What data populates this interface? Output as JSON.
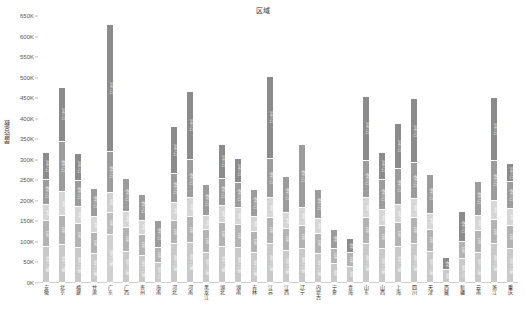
{
  "chart_data": {
    "type": "bar",
    "title": "区域",
    "xlabel": "",
    "ylabel": "居民总数",
    "ylim": [
      0,
      650000
    ],
    "yticks": [
      "0K",
      "50K",
      "100K",
      "150K",
      "200K",
      "250K",
      "300K",
      "350K",
      "400K",
      "450K",
      "500K",
      "550K",
      "600K",
      "650K"
    ],
    "ytick_values": [
      0,
      50000,
      100000,
      150000,
      200000,
      250000,
      300000,
      350000,
      400000,
      450000,
      500000,
      550000,
      600000,
      650000
    ],
    "stacked": true,
    "grid": false,
    "legend": "none",
    "series": [
      {
        "name": "年龄段一",
        "color": "#c9c9c9"
      },
      {
        "name": "年龄段二",
        "color": "#b0b0b0"
      },
      {
        "name": "年龄段三",
        "color": "#d4d4d4"
      },
      {
        "name": "年龄段四",
        "color": "#9a9a9a"
      },
      {
        "name": "年龄段五",
        "color": "#8a8a8a"
      }
    ],
    "categories": [
      "安徽",
      "北京",
      "福建",
      "甘肃",
      "广东",
      "广西",
      "贵州",
      "海南",
      "河北",
      "河南",
      "黑龙江",
      "湖北",
      "湖南",
      "吉林",
      "江苏",
      "江西",
      "辽宁",
      "内蒙古",
      "宁夏",
      "青海",
      "山东",
      "山西",
      "上海",
      "四川",
      "天津",
      "西藏",
      "新疆",
      "云南",
      "浙江",
      "重庆"
    ],
    "bars": [
      {
        "label": "安徽",
        "total": 316000,
        "segments": [
          {
            "value": 88000,
            "label": "青年人口数",
            "shade": "#c9c9c9"
          },
          {
            "value": 62000,
            "label": "壮年",
            "shade": "#b3b3b3"
          },
          {
            "value": 40000,
            "label": "中年",
            "shade": "#d6d6d6"
          },
          {
            "value": 60000,
            "label": "老年人口",
            "shade": "#9c9c9c"
          },
          {
            "value": 66000,
            "label": "少年人口",
            "shade": "#8b8b8b"
          }
        ]
      },
      {
        "label": "北京",
        "total": 476000,
        "segments": [
          {
            "value": 92000,
            "label": "青年人口数",
            "shade": "#c9c9c9"
          },
          {
            "value": 70000,
            "label": "壮年",
            "shade": "#b3b3b3"
          },
          {
            "value": 60000,
            "label": "中年",
            "shade": "#d6d6d6"
          },
          {
            "value": 122000,
            "label": "老年人口",
            "shade": "#9c9c9c"
          },
          {
            "value": 132000,
            "label": "少年人口",
            "shade": "#8b8b8b"
          }
        ]
      },
      {
        "label": "福建",
        "total": 313000,
        "segments": [
          {
            "value": 86000,
            "label": "青年人口数",
            "shade": "#c9c9c9"
          },
          {
            "value": 58000,
            "label": "壮年",
            "shade": "#b3b3b3"
          },
          {
            "value": 42000,
            "label": "中年",
            "shade": "#d6d6d6"
          },
          {
            "value": 62000,
            "label": "老年人口",
            "shade": "#9c9c9c"
          },
          {
            "value": 65000,
            "label": "少年人口",
            "shade": "#8b8b8b"
          }
        ]
      },
      {
        "label": "甘肃",
        "total": 230000,
        "segments": [
          {
            "value": 70000,
            "label": "青年人口数",
            "shade": "#c9c9c9"
          },
          {
            "value": 52000,
            "label": "壮年",
            "shade": "#b3b3b3"
          },
          {
            "value": 38000,
            "label": "中年",
            "shade": "#d6d6d6"
          },
          {
            "value": 70000,
            "label": "老年人口",
            "shade": "#9c9c9c"
          }
        ]
      },
      {
        "label": "广东",
        "total": 628000,
        "segments": [
          {
            "value": 118000,
            "label": "青年人口数",
            "shade": "#d0d0d0"
          },
          {
            "value": 52000,
            "label": "壮年",
            "shade": "#bdbdbd"
          },
          {
            "value": 50000,
            "label": "中年",
            "shade": "#cfcfcf"
          },
          {
            "value": 100000,
            "label": "老年人口",
            "shade": "#9c9c9c"
          },
          {
            "value": 308000,
            "label": "少年人口",
            "shade": "#8b8b8b"
          }
        ]
      },
      {
        "label": "广西",
        "total": 253000,
        "segments": [
          {
            "value": 76000,
            "label": "青年人口数",
            "shade": "#c9c9c9"
          },
          {
            "value": 58000,
            "label": "壮年",
            "shade": "#b3b3b3"
          },
          {
            "value": 40000,
            "label": "中年",
            "shade": "#d6d6d6"
          },
          {
            "value": 79000,
            "label": "老年人口",
            "shade": "#9c9c9c"
          }
        ]
      },
      {
        "label": "贵州",
        "total": 214000,
        "segments": [
          {
            "value": 66000,
            "label": "青年人口数",
            "shade": "#c9c9c9"
          },
          {
            "value": 52000,
            "label": "壮年",
            "shade": "#b3b3b3"
          },
          {
            "value": 34000,
            "label": "中年",
            "shade": "#d6d6d6"
          },
          {
            "value": 62000,
            "label": "老年人口",
            "shade": "#9c9c9c"
          }
        ]
      },
      {
        "label": "海南",
        "total": 150000,
        "segments": [
          {
            "value": 48000,
            "label": "青年人口",
            "shade": "#c9c9c9"
          },
          {
            "value": 38000,
            "label": "壮年",
            "shade": "#b3b3b3"
          },
          {
            "value": 64000,
            "label": "老年人口",
            "shade": "#9c9c9c"
          }
        ]
      },
      {
        "label": "河北",
        "total": 381000,
        "segments": [
          {
            "value": 94000,
            "label": "青年人口数",
            "shade": "#c9c9c9"
          },
          {
            "value": 56000,
            "label": "壮年",
            "shade": "#b3b3b3"
          },
          {
            "value": 46000,
            "label": "中年",
            "shade": "#d6d6d6"
          },
          {
            "value": 70000,
            "label": "老年人口",
            "shade": "#9c9c9c"
          },
          {
            "value": 115000,
            "label": "少年人口",
            "shade": "#8b8b8b"
          }
        ]
      },
      {
        "label": "河南",
        "total": 465000,
        "segments": [
          {
            "value": 98000,
            "label": "青年人口数",
            "shade": "#c9c9c9"
          },
          {
            "value": 62000,
            "label": "壮年",
            "shade": "#b3b3b3"
          },
          {
            "value": 46000,
            "label": "中年",
            "shade": "#d6d6d6"
          },
          {
            "value": 94000,
            "label": "老年人口",
            "shade": "#9c9c9c"
          },
          {
            "value": 165000,
            "label": "少年人口",
            "shade": "#8b8b8b"
          }
        ]
      },
      {
        "label": "黑龙江",
        "total": 239000,
        "segments": [
          {
            "value": 74000,
            "label": "青年人口数",
            "shade": "#c9c9c9"
          },
          {
            "value": 54000,
            "label": "壮年",
            "shade": "#b3b3b3"
          },
          {
            "value": 36000,
            "label": "中年",
            "shade": "#d6d6d6"
          },
          {
            "value": 75000,
            "label": "老年人口",
            "shade": "#9c9c9c"
          }
        ]
      },
      {
        "label": "湖北",
        "total": 336000,
        "segments": [
          {
            "value": 88000,
            "label": "青年人口数",
            "shade": "#c9c9c9"
          },
          {
            "value": 58000,
            "label": "壮年",
            "shade": "#b3b3b3"
          },
          {
            "value": 42000,
            "label": "中年",
            "shade": "#d6d6d6"
          },
          {
            "value": 66000,
            "label": "老年人口",
            "shade": "#9c9c9c"
          },
          {
            "value": 82000,
            "label": "少年人口",
            "shade": "#8b8b8b"
          }
        ]
      },
      {
        "label": "湖南",
        "total": 302000,
        "segments": [
          {
            "value": 86000,
            "label": "青年人口数",
            "shade": "#c9c9c9"
          },
          {
            "value": 56000,
            "label": "壮年",
            "shade": "#b3b3b3"
          },
          {
            "value": 40000,
            "label": "中年",
            "shade": "#d6d6d6"
          },
          {
            "value": 62000,
            "label": "老年人口",
            "shade": "#9c9c9c"
          },
          {
            "value": 58000,
            "label": "少年人口",
            "shade": "#8b8b8b"
          }
        ]
      },
      {
        "label": "吉林",
        "total": 227000,
        "segments": [
          {
            "value": 72000,
            "label": "青年人口数",
            "shade": "#c9c9c9"
          },
          {
            "value": 52000,
            "label": "壮年",
            "shade": "#b3b3b3"
          },
          {
            "value": 36000,
            "label": "中年",
            "shade": "#d6d6d6"
          },
          {
            "value": 67000,
            "label": "老年人口",
            "shade": "#9c9c9c"
          }
        ]
      },
      {
        "label": "江苏",
        "total": 502000,
        "segments": [
          {
            "value": 96000,
            "label": "青年人口数",
            "shade": "#c9c9c9"
          },
          {
            "value": 62000,
            "label": "壮年",
            "shade": "#b3b3b3"
          },
          {
            "value": 48000,
            "label": "中年",
            "shade": "#d6d6d6"
          },
          {
            "value": 96000,
            "label": "老年人口",
            "shade": "#9c9c9c"
          },
          {
            "value": 200000,
            "label": "少年人口",
            "shade": "#8b8b8b"
          }
        ]
      },
      {
        "label": "江西",
        "total": 259000,
        "segments": [
          {
            "value": 78000,
            "label": "青年人口数",
            "shade": "#c9c9c9"
          },
          {
            "value": 54000,
            "label": "壮年",
            "shade": "#b3b3b3"
          },
          {
            "value": 38000,
            "label": "中年",
            "shade": "#d6d6d6"
          },
          {
            "value": 89000,
            "label": "老年人口",
            "shade": "#9c9c9c"
          }
        ]
      },
      {
        "label": "辽宁",
        "total": 336000,
        "segments": [
          {
            "value": 84000,
            "label": "青年人口数",
            "shade": "#c9c9c9"
          },
          {
            "value": 56000,
            "label": "壮年",
            "shade": "#b3b3b3"
          },
          {
            "value": 42000,
            "label": "中年",
            "shade": "#d6d6d6"
          },
          {
            "value": 154000,
            "label": "老年人口",
            "shade": "#9c9c9c"
          }
        ]
      },
      {
        "label": "内蒙古",
        "total": 226000,
        "segments": [
          {
            "value": 70000,
            "label": "青年人口数",
            "shade": "#c9c9c9"
          },
          {
            "value": 50000,
            "label": "壮年",
            "shade": "#b3b3b3"
          },
          {
            "value": 36000,
            "label": "中年",
            "shade": "#d6d6d6"
          },
          {
            "value": 70000,
            "label": "老年人口",
            "shade": "#9c9c9c"
          }
        ]
      },
      {
        "label": "宁夏",
        "total": 130000,
        "segments": [
          {
            "value": 46000,
            "label": "青年",
            "shade": "#c9c9c9"
          },
          {
            "value": 38000,
            "label": "壮年",
            "shade": "#b3b3b3"
          },
          {
            "value": 46000,
            "label": "老年",
            "shade": "#9c9c9c"
          }
        ]
      },
      {
        "label": "青海",
        "total": 108000,
        "segments": [
          {
            "value": 40000,
            "label": "青年",
            "shade": "#c9c9c9"
          },
          {
            "value": 32000,
            "label": "壮年",
            "shade": "#b3b3b3"
          },
          {
            "value": 36000,
            "label": "老年",
            "shade": "#8b8b8b"
          }
        ]
      },
      {
        "label": "山东",
        "total": 453000,
        "segments": [
          {
            "value": 96000,
            "label": "青年人口数",
            "shade": "#c9c9c9"
          },
          {
            "value": 62000,
            "label": "壮年",
            "shade": "#b3b3b3"
          },
          {
            "value": 48000,
            "label": "中年",
            "shade": "#d6d6d6"
          },
          {
            "value": 92000,
            "label": "老年人口",
            "shade": "#9c9c9c"
          },
          {
            "value": 155000,
            "label": "少年人口",
            "shade": "#8b8b8b"
          }
        ]
      },
      {
        "label": "山西",
        "total": 316000,
        "segments": [
          {
            "value": 82000,
            "label": "青年人口数",
            "shade": "#c9c9c9"
          },
          {
            "value": 56000,
            "label": "壮年",
            "shade": "#b3b3b3"
          },
          {
            "value": 40000,
            "label": "中年",
            "shade": "#d6d6d6"
          },
          {
            "value": 72000,
            "label": "老年人口",
            "shade": "#9c9c9c"
          },
          {
            "value": 66000,
            "label": "少年人口",
            "shade": "#8b8b8b"
          }
        ]
      },
      {
        "label": "上海",
        "total": 386000,
        "segments": [
          {
            "value": 88000,
            "label": "青年人口数",
            "shade": "#c9c9c9"
          },
          {
            "value": 58000,
            "label": "壮年",
            "shade": "#b3b3b3"
          },
          {
            "value": 44000,
            "label": "中年",
            "shade": "#d6d6d6"
          },
          {
            "value": 88000,
            "label": "老年人口",
            "shade": "#9c9c9c"
          },
          {
            "value": 108000,
            "label": "少年人口",
            "shade": "#8b8b8b"
          }
        ]
      },
      {
        "label": "四川",
        "total": 448000,
        "segments": [
          {
            "value": 96000,
            "label": "青年人口数",
            "shade": "#c9c9c9"
          },
          {
            "value": 62000,
            "label": "壮年",
            "shade": "#b3b3b3"
          },
          {
            "value": 46000,
            "label": "中年",
            "shade": "#d6d6d6"
          },
          {
            "value": 88000,
            "label": "老年人口",
            "shade": "#9c9c9c"
          },
          {
            "value": 156000,
            "label": "少年人口",
            "shade": "#8b8b8b"
          }
        ]
      },
      {
        "label": "天津",
        "total": 264000,
        "segments": [
          {
            "value": 76000,
            "label": "青年人口数",
            "shade": "#c9c9c9"
          },
          {
            "value": 54000,
            "label": "壮年",
            "shade": "#b3b3b3"
          },
          {
            "value": 38000,
            "label": "中年",
            "shade": "#d6d6d6"
          },
          {
            "value": 96000,
            "label": "老年人口",
            "shade": "#9c9c9c"
          }
        ]
      },
      {
        "label": "西藏",
        "total": 60000,
        "segments": [
          {
            "value": 32000,
            "label": "青年",
            "shade": "#c9c9c9"
          },
          {
            "value": 28000,
            "label": "老年",
            "shade": "#8b8b8b"
          }
        ]
      },
      {
        "label": "新疆",
        "total": 172000,
        "segments": [
          {
            "value": 58000,
            "label": "青年人口",
            "shade": "#c9c9c9"
          },
          {
            "value": 42000,
            "label": "壮年",
            "shade": "#b3b3b3"
          },
          {
            "value": 72000,
            "label": "老年人口",
            "shade": "#8b8b8b"
          }
        ]
      },
      {
        "label": "云南",
        "total": 246000,
        "segments": [
          {
            "value": 74000,
            "label": "青年人口数",
            "shade": "#c9c9c9"
          },
          {
            "value": 52000,
            "label": "壮年",
            "shade": "#b3b3b3"
          },
          {
            "value": 38000,
            "label": "中年",
            "shade": "#d6d6d6"
          },
          {
            "value": 82000,
            "label": "老年人口",
            "shade": "#9c9c9c"
          }
        ]
      },
      {
        "label": "浙江",
        "total": 451000,
        "segments": [
          {
            "value": 94000,
            "label": "青年人口数",
            "shade": "#c9c9c9"
          },
          {
            "value": 60000,
            "label": "壮年",
            "shade": "#b3b3b3"
          },
          {
            "value": 46000,
            "label": "中年",
            "shade": "#d6d6d6"
          },
          {
            "value": 98000,
            "label": "老年人口",
            "shade": "#9c9c9c"
          },
          {
            "value": 153000,
            "label": "少年人口",
            "shade": "#8b8b8b"
          }
        ]
      },
      {
        "label": "重庆",
        "total": 289000,
        "segments": [
          {
            "value": 82000,
            "label": "青年人口数",
            "shade": "#c9c9c9"
          },
          {
            "value": 56000,
            "label": "壮年",
            "shade": "#b3b3b3"
          },
          {
            "value": 42000,
            "label": "中年",
            "shade": "#d6d6d6"
          },
          {
            "value": 66000,
            "label": "老年人口",
            "shade": "#9c9c9c"
          },
          {
            "value": 43000,
            "label": "少年人口",
            "shade": "#8b8b8b"
          }
        ]
      }
    ]
  }
}
